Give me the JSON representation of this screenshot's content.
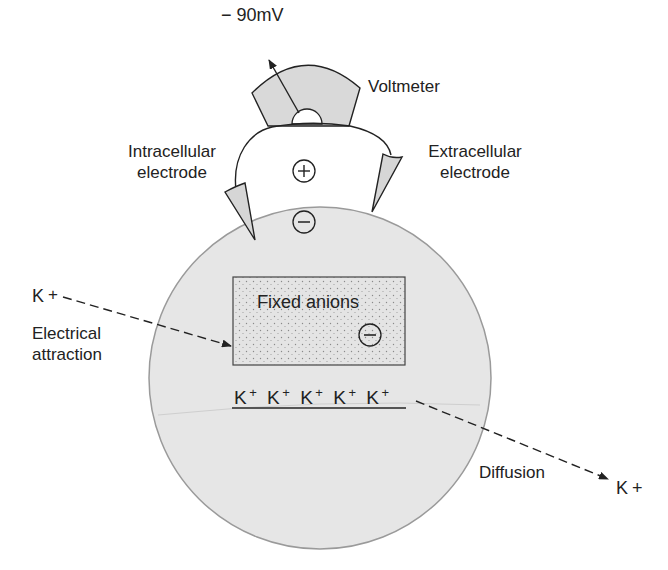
{
  "diagram": {
    "type": "resting-membrane-potential",
    "colors": {
      "cell_fill": "#e6e6e6",
      "cell_stroke": "#9a9a9a",
      "voltmeter_fill": "#d9d9d9",
      "line": "#222222",
      "anion_box_fill": "#e2e2e2"
    },
    "labels": {
      "reading": "− 90mV",
      "voltmeter": "Voltmeter",
      "intracellular_line1": "Intracellular",
      "intracellular_line2": "electrode",
      "extracellular_line1": "Extracellular",
      "extracellular_line2": "electrode",
      "fixed_anions": "Fixed anions",
      "k_left": "K",
      "k_left_sup": "+",
      "electrical_line1": "Electrical",
      "electrical_line2": "attraction",
      "diffusion": "Diffusion",
      "k_right": "K",
      "k_right_sup": "+"
    },
    "charges": {
      "outside": "+",
      "inside": "−",
      "anions": "−"
    },
    "k_ions": [
      {
        "symbol": "K",
        "charge": "+"
      },
      {
        "symbol": "K",
        "charge": "+"
      },
      {
        "symbol": "K",
        "charge": "+"
      },
      {
        "symbol": "K",
        "charge": "+"
      },
      {
        "symbol": "K",
        "charge": "+"
      }
    ]
  }
}
